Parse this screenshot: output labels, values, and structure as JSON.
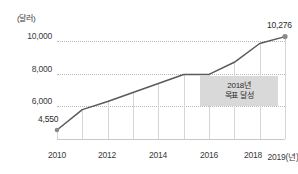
{
  "chart_data": {
    "type": "line",
    "title": "",
    "subtitle": "",
    "xlabel": "",
    "ylabel": "",
    "y_unit_label": "(달러)",
    "x_axis_suffix": "(년)",
    "grid": "dotted-horizontal-and-solid-vertical",
    "legend_position": "none",
    "ylim": [
      4000,
      10800
    ],
    "yticks": [
      "6,000",
      "8,000",
      "10,000"
    ],
    "ytick_values": [
      6000,
      8000,
      10000
    ],
    "xticks": [
      "2010",
      "2012",
      "2014",
      "2016",
      "2018",
      "2019(년)"
    ],
    "x": [
      2010,
      2011,
      2012,
      2013,
      2014,
      2015,
      2016,
      2017,
      2018,
      2019
    ],
    "values": [
      4550,
      5800,
      6300,
      6850,
      7400,
      7950,
      7960,
      8700,
      9850,
      10276
    ],
    "series": [
      {
        "name": "1인당 국민소득",
        "values": [
          4550,
          5800,
          6300,
          6850,
          7400,
          7950,
          7960,
          8700,
          9850,
          10276
        ],
        "color": "#5a5a5a"
      }
    ],
    "point_labels": [
      {
        "x": 2010,
        "value": 4550,
        "text": "4,550"
      },
      {
        "x": 2019,
        "value": 10276,
        "text": "10,276"
      }
    ],
    "markers": [
      {
        "x": 2010,
        "value": 4550
      },
      {
        "x": 2019,
        "value": 10276
      }
    ],
    "annotations": [
      {
        "id": "goal-box",
        "line1": "2018년",
        "line2": "목표 달성"
      }
    ],
    "colors": {
      "line": "#5a5a5a",
      "marker": "#8a8a8a",
      "gridline_horizontal": "#b9b9b9",
      "gridline_vertical": "#d6d6d6",
      "axis": "#c9c9c9",
      "text": "#3a3a3a",
      "callout_background": "#d9d9d9"
    }
  }
}
